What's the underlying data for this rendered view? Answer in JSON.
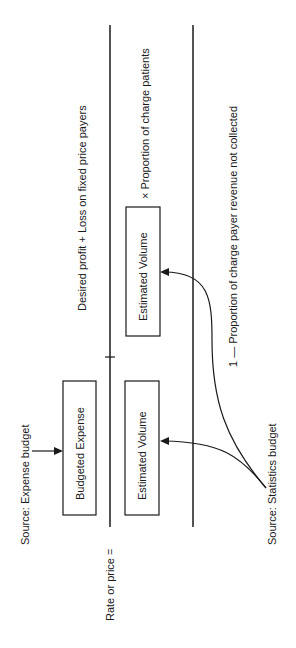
{
  "diagram": {
    "orientation": "rotated -90deg",
    "formula": {
      "lhs": "Rate or price =",
      "numerator": {
        "term1": {
          "label": "Budgeted Expense",
          "source": "Source: Expense budget"
        },
        "plus_text": "Desired profit + Loss on fixed price payers"
      },
      "denominator": {
        "term1": {
          "label": "Estimated Volume"
        },
        "term2": {
          "label": "Estimated Volume",
          "multiplier_text": "× Proportion of charge patients"
        },
        "factor_text": "1 — Proportion of charge payer revenue not collected",
        "source": "Source: Statistics budget"
      }
    },
    "colors": {
      "line": "#1a1a1a",
      "background": "#ffffff"
    }
  }
}
